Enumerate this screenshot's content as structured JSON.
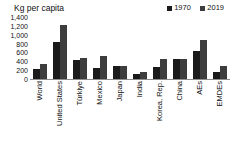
{
  "chart_data": {
    "type": "bar",
    "title": "",
    "ylabel": "Kg per capita",
    "xlabel": "",
    "ylim": [
      0,
      1400
    ],
    "yticks": [
      0,
      200,
      400,
      600,
      800,
      1000,
      1200,
      1400
    ],
    "ytick_labels": [
      "0",
      "200",
      "400",
      "600",
      "800",
      "1,000",
      "1,200",
      "1,400"
    ],
    "grid": false,
    "legend_position": "top-right",
    "categories": [
      "World",
      "United States",
      "Türkiye",
      "Mexico",
      "Japan",
      "India",
      "Korea, Rep.",
      "China",
      "AEs",
      "EMDEs"
    ],
    "series": [
      {
        "name": "1970",
        "color": "#1a1a1a",
        "values": [
          220,
          840,
          440,
          250,
          290,
          110,
          265,
          460,
          640,
          160
        ]
      },
      {
        "name": "2019",
        "color": "#3d3d3d",
        "values": [
          330,
          1210,
          465,
          520,
          290,
          165,
          460,
          460,
          870,
          300
        ]
      }
    ]
  },
  "axis": {
    "y_title": "Kg per capita"
  },
  "colors": {
    "axis_line": "#8d8d8d",
    "text": "#111111",
    "background": "#ffffff"
  }
}
